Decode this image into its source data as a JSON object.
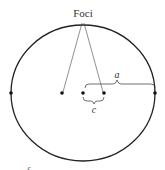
{
  "diagram": {
    "title_label": "Foci",
    "semi_major_label": "a",
    "focal_distance_label": "c",
    "stray_label": "c",
    "colors": {
      "stroke": "#222222",
      "text": "#333333",
      "background": "#ffffff"
    },
    "ellipse": {
      "cx": 83,
      "cy": 93,
      "rx": 72,
      "ry": 68
    },
    "points": [
      {
        "name": "left-vertex",
        "x": 11,
        "y": 93
      },
      {
        "name": "left-focus",
        "x": 62,
        "y": 93
      },
      {
        "name": "center",
        "x": 83,
        "y": 93
      },
      {
        "name": "right-focus",
        "x": 104,
        "y": 93
      },
      {
        "name": "right-vertex",
        "x": 155,
        "y": 93
      }
    ]
  }
}
